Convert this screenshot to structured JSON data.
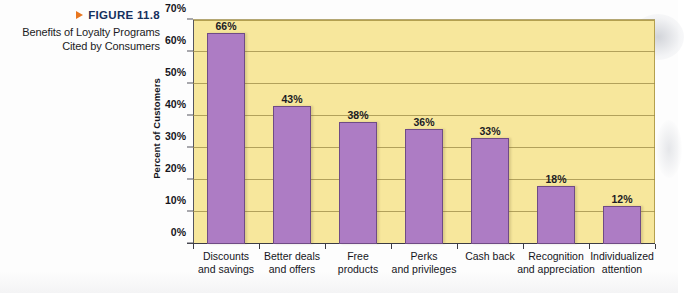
{
  "caption": {
    "figure_label": "FIGURE 11.8",
    "marker_icon": "triangle-right-icon",
    "line1": "Benefits of Loyalty Programs",
    "line2": "Cited by Consumers"
  },
  "colors": {
    "bar_fill": "#ad7cc4",
    "bar_stroke": "#6f4b85",
    "plot_background": "#f7e79c",
    "gridline": "#9b8a46",
    "figure_label": "#15305e",
    "marker": "#e8761f"
  },
  "chart_data": {
    "type": "bar",
    "title": "Benefits of Loyalty Programs Cited by Consumers",
    "xlabel": "",
    "ylabel": "Percent of Customers",
    "ylim": [
      0,
      70
    ],
    "ytick_labels": [
      "0%",
      "10%",
      "20%",
      "30%",
      "40%",
      "50%",
      "60%",
      "70%"
    ],
    "ytick_values": [
      0,
      10,
      20,
      30,
      40,
      50,
      60,
      70
    ],
    "grid": true,
    "legend": false,
    "categories": [
      "Discounts and savings",
      "Better deals and offers",
      "Free products",
      "Perks and privileges",
      "Cash back",
      "Recognition and appreciation",
      "Individualized attention"
    ],
    "category_lines": [
      [
        "Discounts",
        "and savings"
      ],
      [
        "Better deals",
        "and offers"
      ],
      [
        "Free",
        "products"
      ],
      [
        "Perks",
        "and privileges"
      ],
      [
        "Cash back",
        ""
      ],
      [
        "Recognition",
        "and appreciation"
      ],
      [
        "Individualized",
        "attention"
      ]
    ],
    "values": [
      66,
      43,
      38,
      36,
      33,
      18,
      12
    ],
    "data_labels": [
      "66%",
      "43%",
      "38%",
      "36%",
      "33%",
      "18%",
      "12%"
    ]
  }
}
